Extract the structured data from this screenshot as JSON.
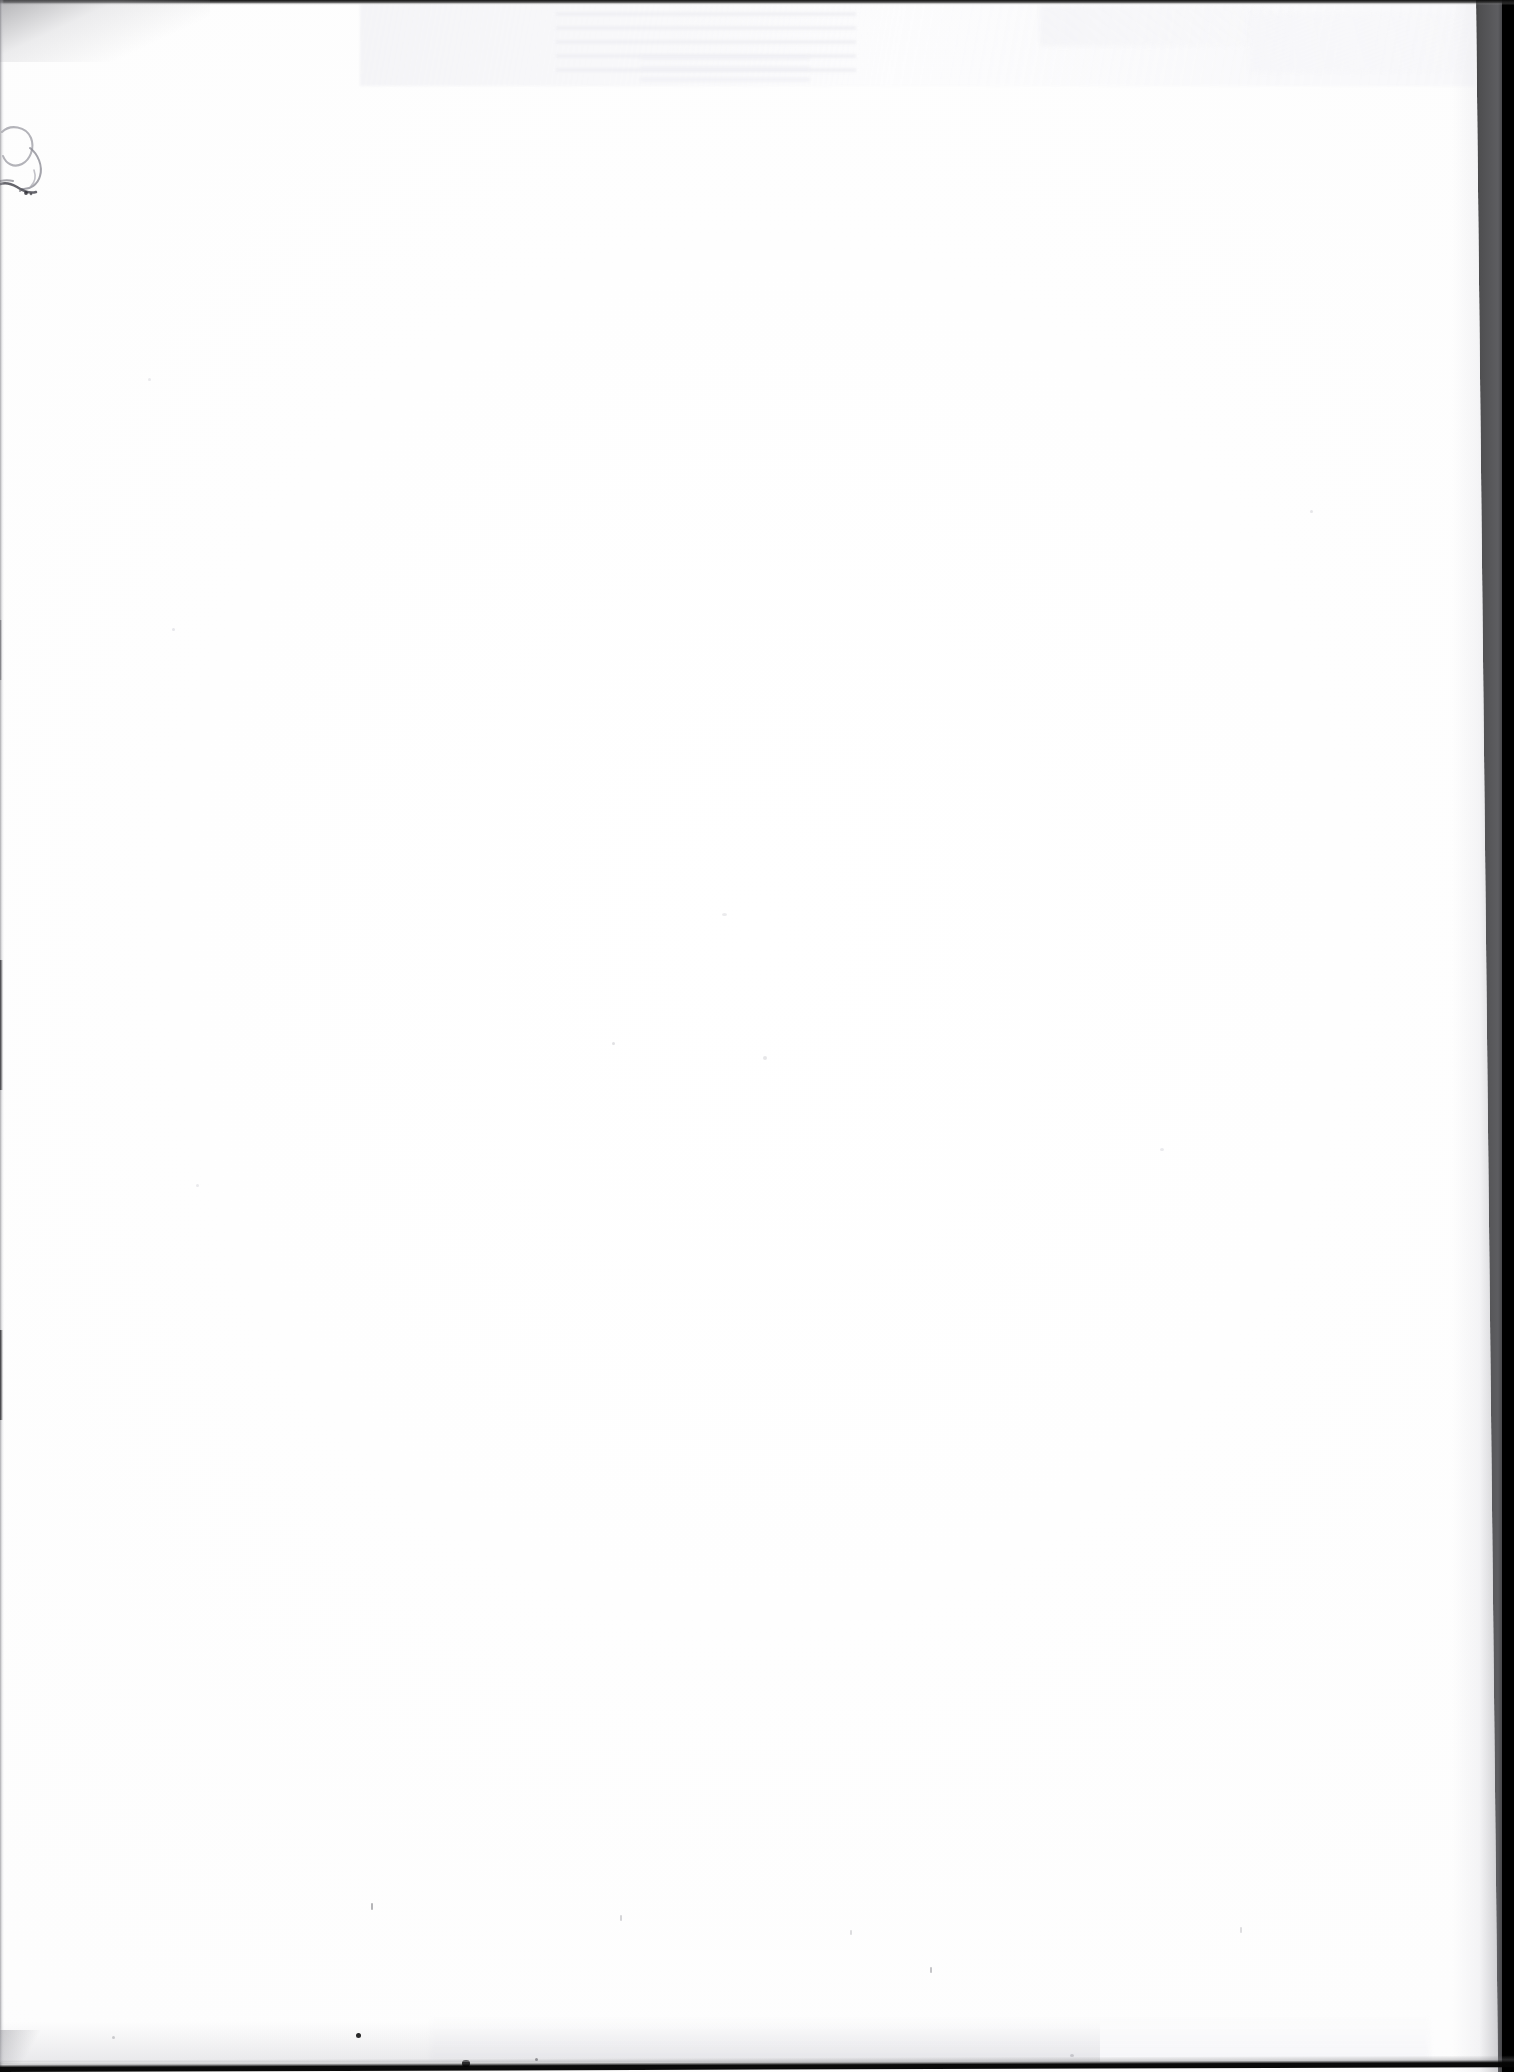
{
  "document": {
    "kind": "scanned-page",
    "page_content": "",
    "page_state_label": "blank",
    "orientation": "portrait"
  },
  "canvas": {
    "width": 1514,
    "height": 2072,
    "background_color": "#000000"
  },
  "paper": {
    "color": "#ffffff",
    "tone_color": "#fdfdfd",
    "top_left_x": 0,
    "top_right_x": 1476,
    "bottom_right_x": 1498,
    "bottom_left_x": 0
  },
  "scanner_edges": {
    "top": {
      "label": "top-edge-shadow",
      "color": "#0a0a0a",
      "thickness_px": 5
    },
    "left": {
      "label": "left-edge-shadow",
      "color": "#787880",
      "thickness_px": 4
    },
    "bottom": {
      "label": "bottom-edge-shadow",
      "color": "#050505",
      "thickness_px": 12
    },
    "right": {
      "label": "right-background-band",
      "color": "#000000",
      "start_x_top": 1476,
      "start_x_bottom": 1498
    }
  },
  "artifacts": {
    "ghost_showthrough": {
      "label": "faint show-through from reverse side",
      "color": "#eeeef2",
      "region": {
        "x": 360,
        "y": 4,
        "width": 1115,
        "height": 82
      }
    },
    "ink_mark": {
      "label": "faint handwritten ink stroke",
      "color": "#6e6e78",
      "region": {
        "x": 0,
        "y": 118,
        "width": 80,
        "height": 92
      }
    },
    "specks": [
      {
        "label": "dark-speck",
        "x": 356,
        "y": 2033,
        "size": 5,
        "color": "#0d0d0d"
      },
      {
        "label": "dark-speck",
        "x": 462,
        "y": 2060,
        "size": 8,
        "color": "#080808"
      },
      {
        "label": "faint-speck",
        "x": 535,
        "y": 2058,
        "size": 3,
        "color": "#3c3c40"
      }
    ]
  }
}
